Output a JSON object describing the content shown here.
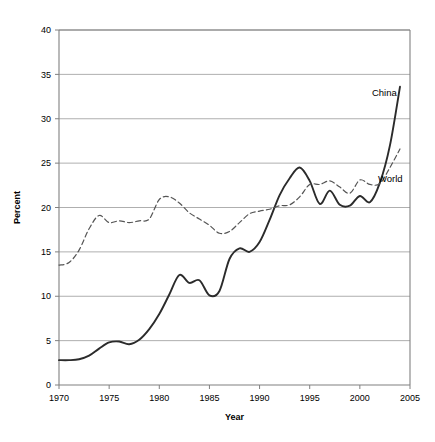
{
  "chart_data": {
    "type": "line",
    "title": "",
    "xlabel": "Year",
    "ylabel": "Percent",
    "xlim": [
      1970,
      2005
    ],
    "ylim": [
      0,
      40
    ],
    "xticks": [
      1970,
      1975,
      1980,
      1985,
      1990,
      1995,
      2000,
      2005
    ],
    "xtick_labels": [
      "1970",
      "1975",
      "1980",
      "1985",
      "1990",
      "1995",
      "2000",
      "2005"
    ],
    "yticks": [
      0,
      5,
      10,
      15,
      20,
      25,
      30,
      35,
      40
    ],
    "ytick_labels": [
      "0",
      "5",
      "10",
      "15",
      "20",
      "25",
      "30",
      "35",
      "40"
    ],
    "grid": "horizontal",
    "legend_position": "inline-right",
    "series": [
      {
        "name": "China",
        "style": "solid",
        "color": "#2b2b2b",
        "label_x": 2001.2,
        "label_y": 32.6,
        "x": [
          1970,
          1971,
          1972,
          1973,
          1974,
          1975,
          1976,
          1977,
          1978,
          1979,
          1980,
          1981,
          1982,
          1983,
          1984,
          1985,
          1986,
          1987,
          1988,
          1989,
          1990,
          1991,
          1992,
          1993,
          1994,
          1995,
          1996,
          1997,
          1998,
          1999,
          2000,
          2001,
          2002,
          2003,
          2004
        ],
        "values": [
          2.8,
          2.8,
          2.9,
          3.3,
          4.1,
          4.8,
          4.9,
          4.6,
          5.1,
          6.3,
          8.0,
          10.2,
          12.4,
          11.5,
          11.8,
          10.1,
          10.6,
          14.2,
          15.4,
          15.0,
          16.1,
          18.6,
          21.4,
          23.3,
          24.5,
          23.0,
          20.4,
          21.9,
          20.3,
          20.2,
          21.3,
          20.6,
          22.8,
          27.0,
          33.6
        ]
      },
      {
        "name": "World",
        "style": "dashed",
        "color": "#555555",
        "label_x": 2001.8,
        "label_y": 22.9,
        "x": [
          1970,
          1971,
          1972,
          1973,
          1974,
          1975,
          1976,
          1977,
          1978,
          1979,
          1980,
          1981,
          1982,
          1983,
          1984,
          1985,
          1986,
          1987,
          1988,
          1989,
          1990,
          1991,
          1992,
          1993,
          1994,
          1995,
          1996,
          1997,
          1998,
          1999,
          2000,
          2001,
          2002,
          2003,
          2004
        ],
        "values": [
          13.5,
          13.8,
          15.2,
          17.6,
          19.1,
          18.3,
          18.5,
          18.3,
          18.5,
          18.7,
          20.9,
          21.2,
          20.5,
          19.4,
          18.7,
          18.0,
          17.1,
          17.3,
          18.3,
          19.3,
          19.6,
          19.8,
          20.2,
          20.3,
          21.2,
          22.6,
          22.6,
          23.0,
          22.3,
          21.6,
          23.1,
          22.6,
          22.7,
          24.5,
          26.6
        ]
      }
    ]
  },
  "plot": {
    "left": 59,
    "top": 30,
    "right": 410,
    "bottom": 385
  }
}
